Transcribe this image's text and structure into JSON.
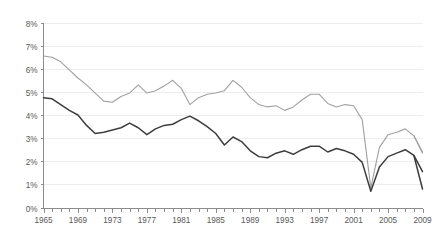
{
  "chart_data": {
    "type": "line",
    "title": "",
    "subtitle": "",
    "xlabel": "",
    "ylabel": "",
    "xlim": [
      1965,
      2009
    ],
    "ylim": [
      0,
      8
    ],
    "grid": true,
    "legend_position": "none",
    "y_tick_labels": [
      "0%",
      "1%",
      "2%",
      "3%",
      "4%",
      "5%",
      "6%",
      "7%",
      "8%"
    ],
    "y_tick_values": [
      0,
      1,
      2,
      3,
      4,
      5,
      6,
      7,
      8
    ],
    "x_tick_labels": [
      "1965",
      "1969",
      "1973",
      "1977",
      "1981",
      "1985",
      "1989",
      "1993",
      "1997",
      "2001",
      "2005",
      "2009"
    ],
    "x_tick_values": [
      1965,
      1969,
      1973,
      1977,
      1981,
      1985,
      1989,
      1993,
      1997,
      2001,
      2005,
      2009
    ],
    "x": [
      1965,
      1966,
      1967,
      1968,
      1969,
      1970,
      1971,
      1972,
      1973,
      1974,
      1975,
      1976,
      1977,
      1978,
      1979,
      1980,
      1981,
      1982,
      1983,
      1984,
      1985,
      1986,
      1987,
      1988,
      1989,
      1990,
      1991,
      1992,
      1993,
      1994,
      1995,
      1996,
      1997,
      1998,
      1999,
      2000,
      2001,
      2002,
      2003,
      2004,
      2005,
      2006,
      2007,
      2008,
      2009
    ],
    "series": [
      {
        "name": "upper-series",
        "color": "#a0a0a0",
        "values": [
          6.55,
          6.5,
          6.3,
          5.95,
          5.6,
          5.3,
          4.95,
          4.6,
          4.55,
          4.8,
          4.95,
          5.3,
          4.95,
          5.05,
          5.25,
          5.5,
          5.15,
          4.45,
          4.75,
          4.9,
          4.95,
          5.05,
          5.5,
          5.2,
          4.75,
          4.45,
          4.35,
          4.4,
          4.2,
          4.35,
          4.65,
          4.9,
          4.9,
          4.5,
          4.35,
          4.45,
          4.4,
          3.8,
          0.85,
          2.6,
          3.15,
          3.25,
          3.4,
          3.1,
          2.35
        ]
      },
      {
        "name": "lower-series",
        "color": "#3d3d3d",
        "values": [
          4.75,
          4.7,
          4.45,
          4.2,
          4.0,
          3.55,
          3.2,
          3.25,
          3.35,
          3.45,
          3.65,
          3.45,
          3.15,
          3.4,
          3.55,
          3.6,
          3.8,
          3.95,
          3.75,
          3.5,
          3.2,
          2.7,
          3.05,
          2.85,
          2.45,
          2.2,
          2.15,
          2.35,
          2.45,
          2.3,
          2.5,
          2.65,
          2.65,
          2.4,
          2.55,
          2.45,
          2.3,
          1.95,
          0.7,
          1.75,
          2.2,
          2.35,
          2.5,
          2.25,
          0.8
        ]
      },
      {
        "name": "upper-series-tail",
        "color": "#a0a0a0",
        "values": [
          null,
          null,
          null,
          null,
          null,
          null,
          null,
          null,
          null,
          null,
          null,
          null,
          null,
          null,
          null,
          null,
          null,
          null,
          null,
          null,
          null,
          null,
          null,
          null,
          null,
          null,
          null,
          null,
          null,
          null,
          null,
          null,
          null,
          null,
          null,
          null,
          null,
          null,
          null,
          null,
          null,
          null,
          null,
          null,
          2.4
        ]
      },
      {
        "name": "lower-series-tail",
        "color": "#3d3d3d",
        "values": [
          null,
          null,
          null,
          null,
          null,
          null,
          null,
          null,
          null,
          null,
          null,
          null,
          null,
          null,
          null,
          null,
          null,
          null,
          null,
          null,
          null,
          null,
          null,
          null,
          null,
          null,
          null,
          null,
          null,
          null,
          null,
          null,
          null,
          null,
          null,
          null,
          null,
          null,
          null,
          null,
          null,
          null,
          null,
          null,
          1.55
        ]
      }
    ],
    "colors": {
      "gridline": "#ededed",
      "axis": "#8c8c8c",
      "tick_text": "#595959",
      "background": "#ffffff"
    }
  }
}
